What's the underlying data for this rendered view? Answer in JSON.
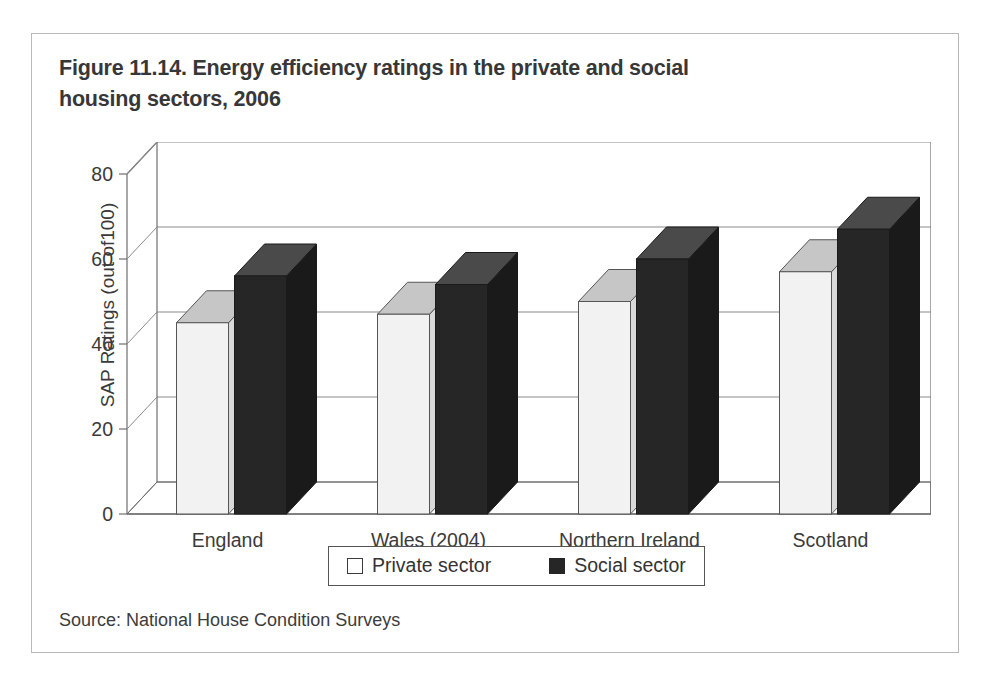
{
  "figure": {
    "title": "Figure 11.14. Energy efficiency ratings in the private and social housing sectors, 2006",
    "source": "Source: National House Condition Surveys"
  },
  "legend": {
    "items": [
      {
        "label": "Private sector",
        "swatch": "open-square-icon",
        "color": "#ffffff"
      },
      {
        "label": "Social sector",
        "swatch": "filled-square-icon",
        "color": "#262626"
      }
    ]
  },
  "chart_data": {
    "type": "bar",
    "title": "Figure 11.14. Energy efficiency ratings in the private and social housing sectors, 2006",
    "xlabel": "",
    "ylabel": "SAP Ratings (out of100)",
    "categories": [
      "England",
      "Wales (2004)",
      "Northern Ireland",
      "Scotland"
    ],
    "series": [
      {
        "name": "Private sector",
        "values": [
          45,
          47,
          50,
          57
        ],
        "color": "#f2f2f2"
      },
      {
        "name": "Social sector",
        "values": [
          56,
          54,
          60,
          67
        ],
        "color": "#262626"
      }
    ],
    "ylim": [
      0,
      80
    ],
    "yticks": [
      0,
      20,
      40,
      60,
      80
    ],
    "ytick_labels": [
      "0",
      "20",
      "40",
      "60",
      "80"
    ],
    "grid": true,
    "three_d": true,
    "legend_position": "bottom"
  },
  "colors": {
    "panel_border": "#b9b9b9",
    "axis": "#6e6e6e",
    "grid": "#8a8a8a",
    "private_face": "#f2f2f2",
    "private_top": "#c6c6c6",
    "social_face": "#262626",
    "social_top": "#4a4a4a",
    "floor": "#767676"
  }
}
